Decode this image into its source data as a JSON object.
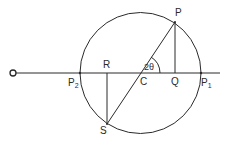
{
  "diagram": {
    "labels": {
      "O": "O",
      "P": "P",
      "Q": "Q",
      "R": "R",
      "S": "S",
      "C": "C",
      "P2": "P",
      "P2_sub": "2",
      "P1": "P",
      "P1_sub": "1",
      "angle": "2θ"
    },
    "colors": {
      "stroke": "#2a2a2a",
      "background": "#ffffff"
    }
  }
}
